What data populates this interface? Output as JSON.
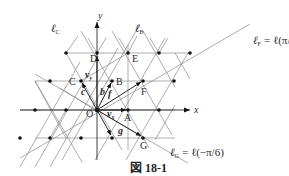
{
  "figure": {
    "caption": "図 18-1",
    "axes": {
      "x_label": "x",
      "y_label": "y"
    },
    "points": [
      {
        "name": "O",
        "label": "O"
      },
      {
        "name": "A",
        "label": "A"
      },
      {
        "name": "B",
        "label": "B"
      },
      {
        "name": "C",
        "label": "C"
      },
      {
        "name": "D",
        "label": "D"
      },
      {
        "name": "E",
        "label": "E"
      },
      {
        "name": "F",
        "label": "F"
      },
      {
        "name": "G",
        "label": "G"
      }
    ],
    "vectors": [
      {
        "name": "v_x",
        "label": "v",
        "sub": "x"
      },
      {
        "name": "v_y",
        "label": "v",
        "sub": "y"
      },
      {
        "name": "b",
        "label": "b"
      },
      {
        "name": "c",
        "label": "c"
      },
      {
        "name": "f",
        "label": "f"
      },
      {
        "name": "g",
        "label": "g"
      }
    ],
    "lines": {
      "l_C": {
        "main": "ℓ",
        "sub": "C"
      },
      "l_B": {
        "main": "ℓ",
        "sub": "B"
      },
      "l_F": {
        "main": "ℓ",
        "sub": "F",
        "rhs": "= ℓ(π/6)"
      },
      "l_G": {
        "main": "ℓ",
        "sub": "G",
        "rhs": "= ℓ(−π/6)"
      }
    }
  }
}
